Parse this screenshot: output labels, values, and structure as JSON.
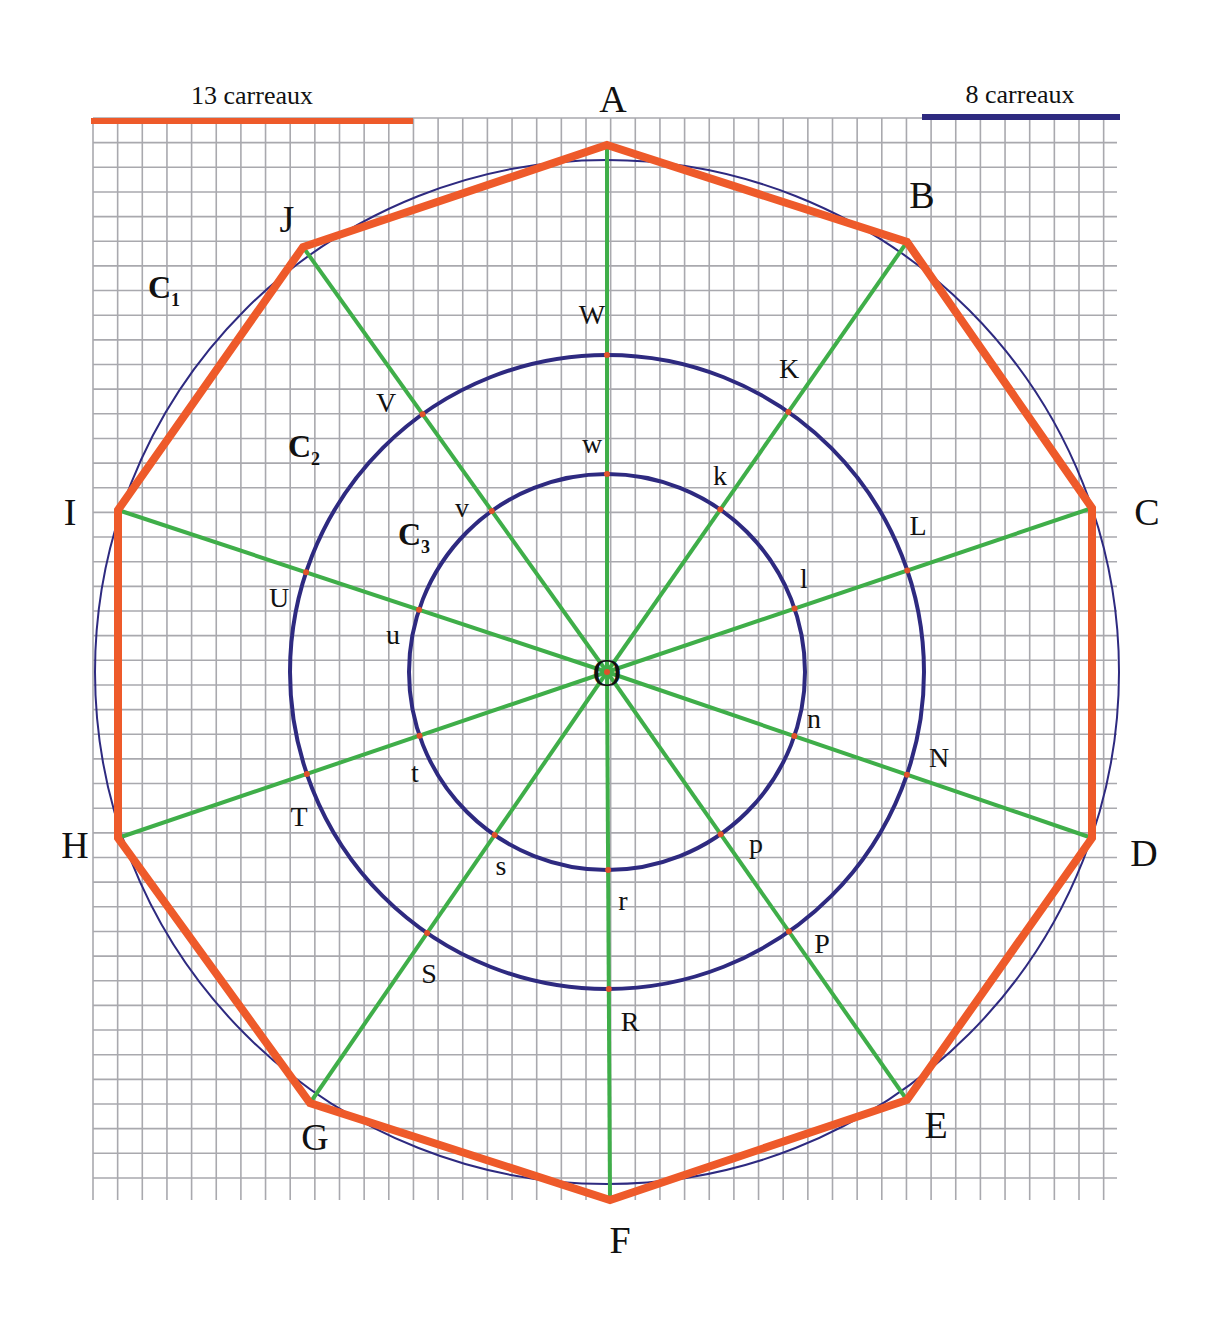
{
  "scale_bars": [
    {
      "label": "13 carreaux",
      "squares": 13,
      "color": "#ee5a2a",
      "x1": 91,
      "x2": 413,
      "y": 121,
      "label_x": 252,
      "label_y": 104
    },
    {
      "label": "8 carreaux",
      "squares": 8,
      "color": "#2e2a80",
      "x1": 922,
      "x2": 1120,
      "y": 117,
      "label_x": 1020,
      "label_y": 103
    }
  ],
  "grid": {
    "x0": 93,
    "y0": 118,
    "x1": 1117,
    "y1": 1200,
    "step": 24.65,
    "color": "#a9a9ae"
  },
  "center": {
    "label": "O",
    "x": 607,
    "y": 672
  },
  "colors": {
    "polygon": "#ee5a2a",
    "circles": "#2e2a80",
    "spokes": "#3fae49",
    "points": "#e0522a"
  },
  "circles": [
    {
      "label": "C",
      "sub": "1",
      "r": 512,
      "stroke_width": 2,
      "label_x": 148,
      "label_y": 298
    },
    {
      "label": "C",
      "sub": "2",
      "r": 317,
      "stroke_width": 4,
      "label_x": 288,
      "label_y": 457
    },
    {
      "label": "C",
      "sub": "3",
      "r": 198,
      "stroke_width": 4,
      "label_x": 398,
      "label_y": 545
    }
  ],
  "decagon_vertices": [
    {
      "label": "A",
      "x": 607,
      "y": 145,
      "lx": 613,
      "ly": 112
    },
    {
      "label": "B",
      "x": 907,
      "y": 242,
      "lx": 922,
      "ly": 208
    },
    {
      "label": "C",
      "x": 1092,
      "y": 508,
      "lx": 1147,
      "ly": 525
    },
    {
      "label": "D",
      "x": 1092,
      "y": 838,
      "lx": 1144,
      "ly": 866
    },
    {
      "label": "E",
      "x": 907,
      "y": 1100,
      "lx": 936,
      "ly": 1138
    },
    {
      "label": "F",
      "x": 610,
      "y": 1200,
      "lx": 620,
      "ly": 1253
    },
    {
      "label": "G",
      "x": 310,
      "y": 1103,
      "lx": 315,
      "ly": 1150
    },
    {
      "label": "H",
      "x": 118,
      "y": 838,
      "lx": 75,
      "ly": 858
    },
    {
      "label": "I",
      "x": 118,
      "y": 510,
      "lx": 70,
      "ly": 525
    },
    {
      "label": "J",
      "x": 303,
      "y": 247,
      "lx": 287,
      "ly": 232
    }
  ],
  "c2_points": [
    {
      "label": "W",
      "lx": 592,
      "ly": 324
    },
    {
      "label": "K",
      "lx": 789,
      "ly": 378
    },
    {
      "label": "L",
      "lx": 918,
      "ly": 535
    },
    {
      "label": "N",
      "lx": 939,
      "ly": 767
    },
    {
      "label": "P",
      "lx": 822,
      "ly": 953
    },
    {
      "label": "R",
      "lx": 630,
      "ly": 1031
    },
    {
      "label": "S",
      "lx": 429,
      "ly": 983
    },
    {
      "label": "T",
      "lx": 299,
      "ly": 826
    },
    {
      "label": "U",
      "lx": 279,
      "ly": 607
    },
    {
      "label": "V",
      "lx": 386,
      "ly": 412
    }
  ],
  "c3_points": [
    {
      "label": "w",
      "lx": 592,
      "ly": 453
    },
    {
      "label": "k",
      "lx": 720,
      "ly": 485
    },
    {
      "label": "l",
      "lx": 804,
      "ly": 588
    },
    {
      "label": "n",
      "lx": 814,
      "ly": 728
    },
    {
      "label": "p",
      "lx": 756,
      "ly": 853
    },
    {
      "label": "r",
      "lx": 623,
      "ly": 910
    },
    {
      "label": "s",
      "lx": 501,
      "ly": 875
    },
    {
      "label": "t",
      "lx": 415,
      "ly": 782
    },
    {
      "label": "u",
      "lx": 393,
      "ly": 644
    },
    {
      "label": "v",
      "lx": 462,
      "ly": 517
    }
  ]
}
